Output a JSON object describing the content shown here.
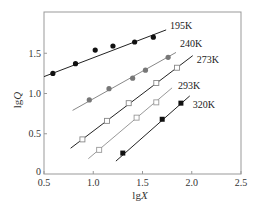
{
  "chart_data": {
    "type": "scatter",
    "title": "",
    "xlabel": "lgX",
    "ylabel": "lgQ",
    "xlim": [
      0.5,
      2.5
    ],
    "ylim": [
      0,
      2.0
    ],
    "xticks": [
      0.5,
      1.0,
      1.5,
      2.0,
      2.5
    ],
    "xtick_labels": [
      "0.5",
      "1.0",
      "1.5",
      "2.0",
      "2.5"
    ],
    "yticks": [
      0,
      0.5,
      1.0,
      1.5
    ],
    "ytick_labels": [
      "0",
      "0.5",
      "1.0",
      "1.5"
    ],
    "grid": false,
    "legend": "inline labels at line ends",
    "series": [
      {
        "name": "195K",
        "marker": "filled-circle",
        "marker_color": "#111111",
        "line_color": "#222222",
        "x": [
          0.59,
          0.82,
          1.02,
          1.2,
          1.42,
          1.61
        ],
        "y": [
          1.25,
          1.37,
          1.54,
          1.59,
          1.64,
          1.7
        ],
        "fit_line": [
          [
            0.5,
            1.21
          ],
          [
            1.74,
            1.79
          ]
        ],
        "label_pos": [
          1.78,
          1.84
        ]
      },
      {
        "name": "240K",
        "marker": "filled-circle-gray",
        "marker_color": "#777777",
        "line_color": "#888888",
        "x": [
          0.96,
          1.16,
          1.4,
          1.53,
          1.76
        ],
        "y": [
          0.92,
          1.06,
          1.19,
          1.29,
          1.45
        ],
        "fit_line": [
          [
            0.79,
            0.79
          ],
          [
            1.84,
            1.51
          ]
        ],
        "label_pos": [
          1.88,
          1.62
        ]
      },
      {
        "name": "273K",
        "marker": "open-square",
        "marker_color": "#888888",
        "line_color": "#222222",
        "x": [
          0.89,
          1.14,
          1.36,
          1.64,
          1.85
        ],
        "y": [
          0.43,
          0.66,
          0.88,
          1.13,
          1.32
        ],
        "fit_line": [
          [
            0.77,
            0.32
          ],
          [
            2.01,
            1.47
          ]
        ],
        "label_pos": [
          2.05,
          1.42
        ]
      },
      {
        "name": "293K",
        "marker": "open-square",
        "marker_color": "#999999",
        "line_color": "#999999",
        "x": [
          1.06,
          1.44,
          1.64
        ],
        "y": [
          0.3,
          0.7,
          0.89
        ],
        "fit_line": [
          [
            0.95,
            0.19
          ],
          [
            1.8,
            1.07
          ]
        ],
        "label_pos": [
          1.86,
          1.1
        ]
      },
      {
        "name": "320K",
        "marker": "filled-square",
        "marker_color": "#111111",
        "line_color": "#222222",
        "x": [
          1.3,
          1.7,
          1.89
        ],
        "y": [
          0.26,
          0.68,
          0.88
        ],
        "fit_line": [
          [
            1.23,
            0.16
          ],
          [
            1.98,
            0.97
          ]
        ],
        "label_pos": [
          2.01,
          0.86
        ]
      }
    ]
  }
}
